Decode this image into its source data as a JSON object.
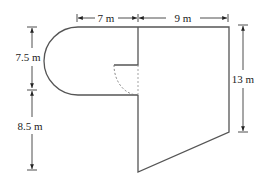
{
  "diagram": {
    "type": "composite-shape-dimensions",
    "shapes": [
      "semicircle",
      "rectangle",
      "trapezoid",
      "quarter-circle (dashed)"
    ],
    "labels": {
      "top_left_width": "7 m",
      "top_right_width": "9 m",
      "left_upper_height": "7.5 m",
      "left_lower_height": "8.5 m",
      "right_height": "13 m"
    },
    "colors": {
      "stroke": "#555555",
      "arrow": "#222222",
      "text": "#222222"
    }
  }
}
